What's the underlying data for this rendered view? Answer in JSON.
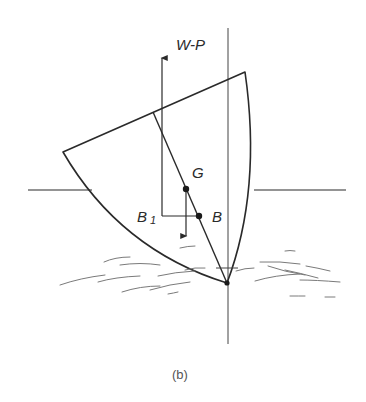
{
  "figure": {
    "caption": "(b)",
    "labels": {
      "force": "W-P",
      "centre_of_gravity": "G",
      "buoyancy_centre": "B",
      "displaced_buoyancy_centre_letter": "B",
      "displaced_buoyancy_centre_sub": "1"
    },
    "colors": {
      "line": "#2a2a2a",
      "water": "#7a7a7a",
      "background": "#ffffff"
    }
  }
}
